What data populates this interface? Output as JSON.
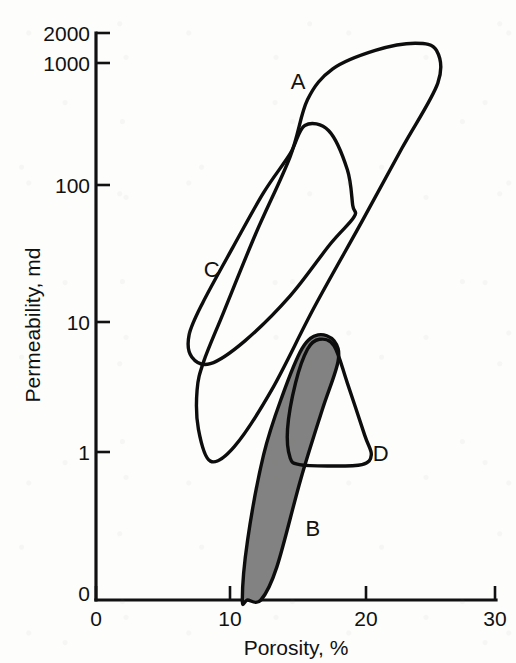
{
  "figure": {
    "background_color": "#fdfdfc",
    "ink_color": "#111111",
    "fill_gray": "#828282"
  },
  "chart_data": {
    "type": "scatter",
    "title": "",
    "xlabel": "Porosity, %",
    "ylabel": "Permeability, md",
    "xscale": "linear",
    "yscale": "log",
    "xlim": [
      0,
      30
    ],
    "ylim": [
      0,
      2000
    ],
    "xticks": [
      0,
      10,
      20,
      30
    ],
    "xtick_labels": [
      "0",
      "10",
      "20",
      "30"
    ],
    "yticks": [
      0,
      1,
      10,
      100,
      1000,
      2000
    ],
    "ytick_labels": [
      "0",
      "1",
      "10",
      "100",
      "1000",
      "2000"
    ],
    "grid": false,
    "legend": "inline-labels",
    "annotations": [
      {
        "label": "A",
        "x": 15.2,
        "y": 700
      },
      {
        "label": "C",
        "x": 8.7,
        "y": 25
      },
      {
        "label": "B",
        "x": 16.3,
        "y": 0.25
      },
      {
        "label": "D",
        "x": 21.4,
        "y": 0.95
      }
    ],
    "series": [
      {
        "name": "A",
        "kind": "closed-region-outline",
        "fill": "none",
        "stroke": "#0d0d0d",
        "description": "Large elongated envelope trending from low porosity / low permeability up to high porosity / very high permeability",
        "x_range": [
          7.5,
          26.0
        ],
        "y_range": [
          4.5,
          1500
        ],
        "vertices": [
          [
            8.1,
            5.0
          ],
          [
            9.6,
            12.0
          ],
          [
            12.0,
            48.0
          ],
          [
            14.6,
            190.0
          ],
          [
            15.9,
            520.0
          ],
          [
            17.8,
            900.0
          ],
          [
            21.0,
            1250.0
          ],
          [
            24.0,
            1420.0
          ],
          [
            25.6,
            1250.0
          ],
          [
            25.7,
            700.0
          ],
          [
            23.0,
            220.0
          ],
          [
            20.0,
            60.0
          ],
          [
            16.4,
            13.0
          ],
          [
            13.2,
            3.0
          ],
          [
            10.4,
            1.1
          ],
          [
            8.6,
            0.85
          ],
          [
            7.7,
            1.5
          ],
          [
            7.6,
            3.0
          ]
        ]
      },
      {
        "name": "C",
        "kind": "closed-region-outline",
        "fill": "none",
        "stroke": "#0d0d0d",
        "description": "Narrow elongated envelope inside/left of A, lower permeability ceiling",
        "x_range": [
          7.0,
          19.6
        ],
        "y_range": [
          4.6,
          340
        ],
        "vertices": [
          [
            14.6,
            200.0
          ],
          [
            15.7,
            330.0
          ],
          [
            17.5,
            300.0
          ],
          [
            18.9,
            150.0
          ],
          [
            19.3,
            80.0
          ],
          [
            19.4,
            65.0
          ],
          [
            17.6,
            40.0
          ],
          [
            14.6,
            16.0
          ],
          [
            11.2,
            7.2
          ],
          [
            8.6,
            4.8
          ],
          [
            7.2,
            5.4
          ],
          [
            7.0,
            8.0
          ],
          [
            8.0,
            14.0
          ],
          [
            10.3,
            38.0
          ],
          [
            12.6,
            100.0
          ]
        ]
      },
      {
        "name": "B",
        "kind": "closed-region-filled",
        "fill": "#828282",
        "stroke": "#0d0d0d",
        "description": "Shaded grey elongated region, lowest permeability band rising to moderate values",
        "x_range": [
          11.0,
          18.3
        ],
        "y_range": [
          0.03,
          8.0
        ],
        "vertices": [
          [
            15.5,
            6.3
          ],
          [
            16.7,
            8.0
          ],
          [
            17.9,
            7.2
          ],
          [
            18.2,
            5.0
          ],
          [
            17.0,
            2.1
          ],
          [
            15.4,
            0.62
          ],
          [
            13.6,
            0.13
          ],
          [
            12.4,
            0.038
          ],
          [
            11.4,
            0.031
          ],
          [
            11.0,
            0.055
          ],
          [
            11.4,
            0.21
          ],
          [
            12.6,
            0.95
          ],
          [
            14.0,
            2.7
          ]
        ]
      },
      {
        "name": "D",
        "kind": "closed-region-outline",
        "fill": "none",
        "stroke": "#0d0d0d",
        "description": "Triangular envelope overlapping the shaded B region",
        "x_range": [
          14.4,
          20.7
        ],
        "y_range": [
          0.72,
          7.4
        ],
        "vertices": [
          [
            16.8,
            7.4
          ],
          [
            17.9,
            6.6
          ],
          [
            18.9,
            3.4
          ],
          [
            20.2,
            1.35
          ],
          [
            20.7,
            0.95
          ],
          [
            20.0,
            0.8
          ],
          [
            17.4,
            0.78
          ],
          [
            15.3,
            0.8
          ],
          [
            14.6,
            0.9
          ],
          [
            14.4,
            1.5
          ],
          [
            15.0,
            3.4
          ],
          [
            15.9,
            6.2
          ]
        ]
      }
    ]
  }
}
